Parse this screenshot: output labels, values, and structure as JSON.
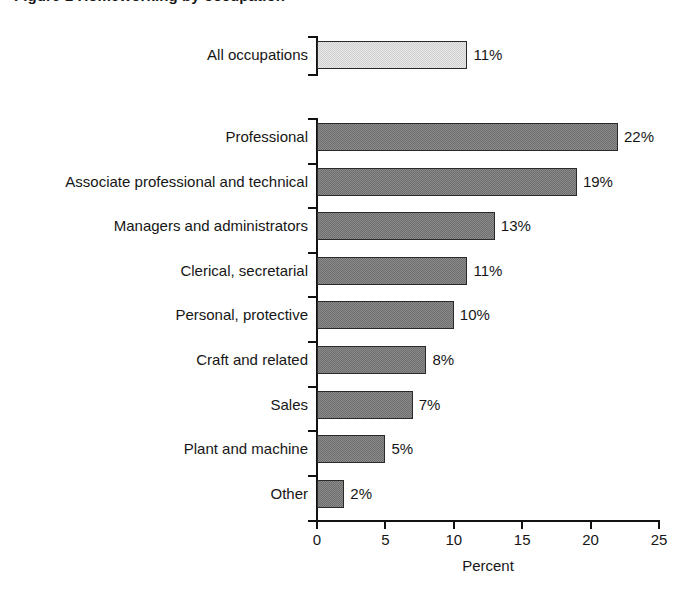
{
  "figure": {
    "title": "Figure 1  Homeworking by occupation",
    "title_visible_note": "top of title cropped out of frame"
  },
  "chart_data": {
    "type": "bar",
    "orientation": "horizontal",
    "title": "Figure 1  Homeworking by occupation",
    "xlabel": "Percent",
    "ylabel": "",
    "xlim": [
      0,
      25
    ],
    "xticks": [
      0,
      5,
      10,
      15,
      20,
      25
    ],
    "xtick_labels": [
      "0",
      "5",
      "10",
      "15",
      "20",
      "25"
    ],
    "grid": false,
    "legend": false,
    "value_label_suffix": "%",
    "summary": {
      "category": "All occupations",
      "value": 11,
      "label": "11%",
      "color": "#cfcfcf"
    },
    "bar_color": "#6e6e6e",
    "categories": [
      "Professional",
      "Associate professional and technical",
      "Managers and administrators",
      "Clerical, secretarial",
      "Personal, protective",
      "Craft and related",
      "Sales",
      "Plant and machine",
      "Other"
    ],
    "values": [
      22,
      19,
      13,
      11,
      10,
      8,
      7,
      5,
      2
    ],
    "value_labels": [
      "22%",
      "19%",
      "13%",
      "11%",
      "10%",
      "8%",
      "7%",
      "5%",
      "2%"
    ]
  }
}
